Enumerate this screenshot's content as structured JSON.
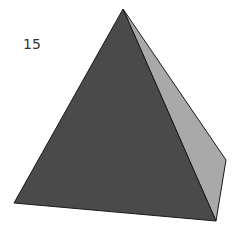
{
  "figure": {
    "label": "15",
    "shape": "square pyramid",
    "colors": {
      "front_face": "#4a4a4a",
      "side_face": "#a9a9a9",
      "edge": "#1a1a1a",
      "background": "#ffffff"
    },
    "vertices": {
      "apex": [
        123,
        9
      ],
      "front_left": [
        14,
        203
      ],
      "front_right": [
        216,
        221
      ],
      "back_right": [
        226,
        160
      ]
    }
  }
}
